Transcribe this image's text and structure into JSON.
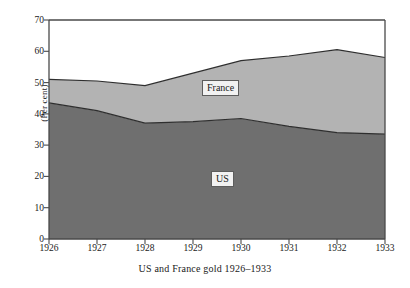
{
  "chart_data": {
    "type": "area",
    "title": "",
    "caption": "US and France gold 1926–1933",
    "xlabel": "",
    "ylabel": "(Per cent)",
    "stacked": true,
    "grid": false,
    "legend_position": "inline-annotations",
    "categories": [
      "1926",
      "1927",
      "1928",
      "1929",
      "1930",
      "1931",
      "1932",
      "1933"
    ],
    "x": [
      1926,
      1927,
      1928,
      1929,
      1930,
      1931,
      1932,
      1933
    ],
    "xlim": [
      1926,
      1933
    ],
    "ylim": [
      0,
      70
    ],
    "y_ticks": [
      0,
      10,
      20,
      30,
      40,
      50,
      60,
      70
    ],
    "x_ticks": [
      1926,
      1927,
      1928,
      1929,
      1930,
      1931,
      1932,
      1933
    ],
    "series": [
      {
        "name": "US",
        "color": "#6f6f6f",
        "values": [
          43.5,
          41.0,
          37.0,
          37.5,
          38.5,
          36.0,
          34.0,
          33.5
        ]
      },
      {
        "name": "France",
        "color": "#b3b3b3",
        "values": [
          7.5,
          9.5,
          12.0,
          15.5,
          18.5,
          22.5,
          26.5,
          24.5
        ]
      }
    ],
    "cumulative_totals": [
      51.0,
      50.5,
      49.0,
      53.0,
      57.0,
      58.5,
      60.5,
      58.0
    ],
    "annotations": [
      {
        "text": "France",
        "x": 1929.6,
        "y": 47.0
      },
      {
        "text": "US",
        "x": 1929.8,
        "y": 18.5
      }
    ]
  },
  "axes": {
    "y_title": "(Per cent)",
    "y_tick_labels": [
      "70",
      "60",
      "50",
      "40",
      "30",
      "20",
      "10",
      "0"
    ],
    "x_tick_labels": [
      "1926",
      "1927",
      "1928",
      "1929",
      "1930",
      "1931",
      "1932",
      "1933"
    ]
  },
  "caption": {
    "text": "US and France gold 1926–1933"
  },
  "labels": {
    "france": "France",
    "us": "US"
  },
  "colors": {
    "us_fill": "#6f6f6f",
    "france_fill": "#b3b3b3",
    "axis": "#4a4a4a",
    "line": "#2e2e2e",
    "background": "#ffffff"
  }
}
